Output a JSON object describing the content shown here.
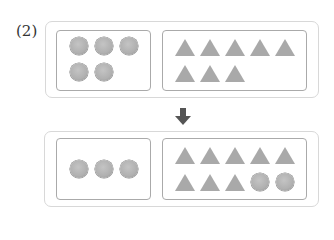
{
  "problem_label": "(2)",
  "colors": {
    "shape_fill": "#a9a9a9",
    "outer_border": "#d8d8d8",
    "inner_border": "#aaaaaa",
    "arrow": "#555555"
  },
  "before": {
    "left_box": {
      "shape": "circle",
      "count": 5
    },
    "right_box": {
      "shape": "triangle",
      "count": 8
    }
  },
  "arrow": {
    "icon": "down-arrow-icon"
  },
  "after": {
    "left_box": {
      "shape": "circle",
      "count": 3
    },
    "right_box": {
      "triangles": 8,
      "circles": 2
    }
  }
}
